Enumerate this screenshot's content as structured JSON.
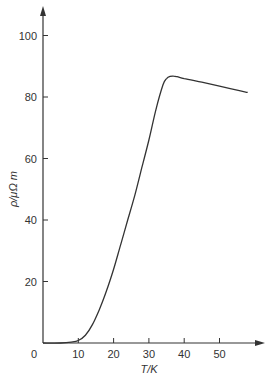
{
  "chart_data": {
    "type": "line",
    "title": "",
    "xlabel": "T/K",
    "ylabel": "ρ/μΩ m",
    "xlim": [
      0,
      60
    ],
    "ylim": [
      0,
      105
    ],
    "x_ticks": [
      0,
      10,
      20,
      30,
      40,
      50
    ],
    "y_ticks": [
      20,
      40,
      60,
      80,
      100
    ],
    "grid": false,
    "legend": null,
    "series": [
      {
        "name": "resistivity",
        "x": [
          0,
          5,
          8,
          10,
          12,
          14,
          16,
          18,
          20,
          22,
          24,
          26,
          28,
          30,
          32,
          34,
          35,
          36,
          37,
          38,
          40,
          45,
          50,
          55,
          58
        ],
        "y": [
          0,
          0,
          0.3,
          0.8,
          2.5,
          6,
          11,
          17,
          24,
          32,
          40,
          48,
          57,
          66,
          76,
          84,
          86,
          86.7,
          86.8,
          86.6,
          86,
          84.8,
          83.5,
          82.2,
          81.5
        ]
      }
    ],
    "color": "#333333"
  }
}
